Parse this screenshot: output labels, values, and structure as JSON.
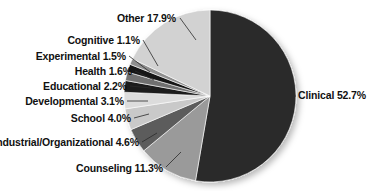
{
  "chart_data": {
    "type": "pie",
    "title": "",
    "subtitle": "",
    "xlabel": "",
    "ylabel": "",
    "legend_position": "none",
    "grid": false,
    "units": "percent",
    "total": 100.0,
    "categories": [
      "Clinical",
      "Other",
      "Cognitive",
      "Experimental",
      "Health",
      "Educational",
      "Developmental",
      "School",
      "Industrial/Organizational",
      "Counseling"
    ],
    "values": [
      52.7,
      17.9,
      1.1,
      1.5,
      1.6,
      2.2,
      3.1,
      4.0,
      4.6,
      11.3
    ],
    "slices": [
      {
        "name": "clinical",
        "label": "Clinical 52.7%",
        "category": "Clinical",
        "value": 52.7,
        "value_label": "52.7%",
        "color": "#2c2c2c",
        "start_angle": 0.0,
        "end_angle": 189.72,
        "label_side": "right",
        "label_x": 298,
        "label_y": 99,
        "leader": "M 288 96 L 296 96"
      },
      {
        "name": "counseling",
        "label": "Counseling 11.3%",
        "category": "Counseling",
        "value": 11.3,
        "value_label": "11.3%",
        "color": "#9a9a9a",
        "start_angle": 189.72,
        "end_angle": 230.4,
        "label_side": "left",
        "label_x": 163,
        "label_y": 172,
        "leader": "M 166 167 L 181 152"
      },
      {
        "name": "industrial-organizational",
        "label": "Industrial/Organizational 4.6%",
        "category": "Industrial/Organizational",
        "value": 4.6,
        "value_label": "4.6%",
        "color": "#5c5c5c",
        "start_angle": 230.4,
        "end_angle": 246.96,
        "label_side": "left",
        "label_x": 139,
        "label_y": 146,
        "leader": "M 142 142 L 157 133"
      },
      {
        "name": "school",
        "label": "School 4.0%",
        "category": "School",
        "value": 4.0,
        "value_label": "4.0%",
        "color": "#c9c9c9",
        "start_angle": 246.96,
        "end_angle": 261.36,
        "label_side": "left",
        "label_x": 131,
        "label_y": 122,
        "leader": "M 134 118 L 149 114"
      },
      {
        "name": "developmental",
        "label": "Developmental 3.1%",
        "category": "Developmental",
        "value": 3.1,
        "value_label": "3.1%",
        "color": "#dcdcdc",
        "start_angle": 261.36,
        "end_angle": 272.52,
        "label_side": "left",
        "label_x": 124,
        "label_y": 105,
        "leader": "M 127 101 L 148 101"
      },
      {
        "name": "educational",
        "label": "Educational 2.2%",
        "category": "Educational",
        "value": 2.2,
        "value_label": "2.2%",
        "color": "#1f1f1f",
        "start_angle": 272.52,
        "end_angle": 280.44,
        "label_side": "left",
        "label_x": 127,
        "label_y": 90,
        "leader": "M 130 86 L 151 88"
      },
      {
        "name": "health",
        "label": "Health 1.6%",
        "category": "Health",
        "value": 1.6,
        "value_label": "1.6%",
        "color": "#707070",
        "start_angle": 280.44,
        "end_angle": 286.2,
        "label_side": "left",
        "label_x": 132,
        "label_y": 75,
        "leader": "M 135 71 L 154 80"
      },
      {
        "name": "experimental",
        "label": "Experimental 1.5%",
        "category": "Experimental",
        "value": 1.5,
        "value_label": "1.5%",
        "color": "#141414",
        "start_angle": 286.2,
        "end_angle": 291.6,
        "label_side": "left",
        "label_x": 126,
        "label_y": 60,
        "leader": "M 129 56 L 150 72"
      },
      {
        "name": "cognitive",
        "label": "Cognitive 1.1%",
        "category": "Cognitive",
        "value": 1.1,
        "value_label": "1.1%",
        "color": "#8f8f8f",
        "start_angle": 291.6,
        "end_angle": 295.56,
        "label_side": "left",
        "label_x": 140,
        "label_y": 44,
        "leader": "M 143 40 L 158 66"
      },
      {
        "name": "other",
        "label": "Other 17.9%",
        "category": "Other",
        "value": 17.9,
        "value_label": "17.9%",
        "color": "#d2d2d2",
        "start_angle": 295.56,
        "end_angle": 360.0,
        "label_side": "left",
        "label_x": 176,
        "label_y": 22,
        "leader": "M 180 18 L 196 40"
      }
    ],
    "geometry": {
      "center_x": 210,
      "center_y": 96,
      "radius": 86
    }
  }
}
